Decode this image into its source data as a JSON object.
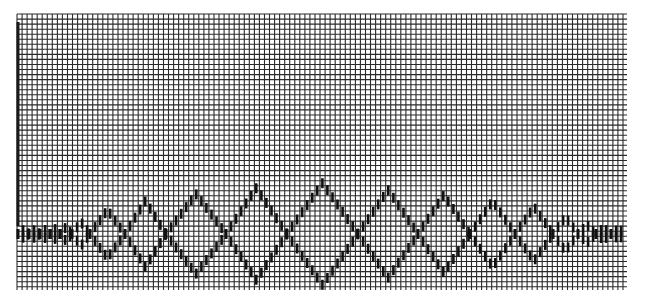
{
  "pattern": {
    "description": "Knitting/weaving style chart grid with diamond zigzag motif",
    "grid": {
      "x0": 17,
      "y0": 14,
      "x1": 627,
      "y1": 290,
      "cell": 5.05,
      "line_color": "#2a2a2a",
      "background": "#ffffff"
    },
    "left_marker": {
      "x": 18,
      "y0": 22,
      "y1": 226,
      "color": "#1a1a1a"
    },
    "centerline_y": 234,
    "mark_color": "#111111",
    "nodes": [
      18,
      29,
      40,
      50,
      60,
      72,
      90,
      125,
      166,
      226,
      287,
      358,
      418,
      470,
      515,
      553,
      578,
      596,
      611,
      626
    ],
    "amplitudes": [
      4,
      4,
      4,
      5,
      7,
      12,
      24,
      33,
      40,
      46,
      51,
      44,
      39,
      33,
      27,
      17,
      9,
      6,
      5
    ]
  }
}
